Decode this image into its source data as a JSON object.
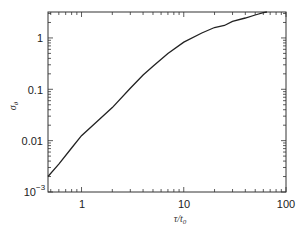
{
  "chart_data": {
    "type": "line",
    "title": "",
    "xlabel": "τ/t₀",
    "ylabel": "σ_θ",
    "xscale": "log",
    "yscale": "log",
    "xlim": [
      0.47,
      100
    ],
    "ylim": [
      0.001,
      3.2
    ],
    "xticks": [
      "1",
      "10",
      "100"
    ],
    "yticks": [
      "10⁻³",
      "0.01",
      "0.1",
      "1"
    ],
    "grid": false,
    "legend": null,
    "series": [
      {
        "name": "σ_θ",
        "x": [
          0.47,
          0.6,
          0.8,
          1.0,
          1.5,
          2.0,
          3.0,
          4.0,
          5.0,
          7.0,
          10.0,
          15.0,
          20.0,
          25.0,
          30.0,
          40.0,
          50.0,
          60.0,
          65.0
        ],
        "y": [
          0.002,
          0.0035,
          0.0072,
          0.0125,
          0.026,
          0.044,
          0.105,
          0.19,
          0.28,
          0.5,
          0.83,
          1.25,
          1.6,
          1.75,
          2.1,
          2.45,
          2.8,
          3.1,
          3.2
        ]
      }
    ]
  },
  "axes": {
    "x_tick_labels": [
      "1",
      "10",
      "100"
    ],
    "y_tick_labels": [
      "0.01",
      "0.1",
      "1"
    ],
    "y_bottom_base": "10",
    "y_bottom_exp": "−3",
    "x_label_main": "τ/t",
    "x_label_sub": "0",
    "y_label_main": "σ",
    "y_label_sub": "θ"
  }
}
